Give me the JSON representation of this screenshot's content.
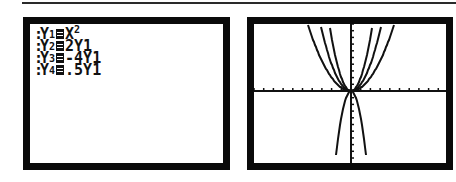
{
  "y_editor": {
    "functions": [
      {
        "name": "Y",
        "sub": "1",
        "expr": "X",
        "expr_sup": "2"
      },
      {
        "name": "Y",
        "sub": "2",
        "expr": "2Y1",
        "expr_sup": ""
      },
      {
        "name": "Y",
        "sub": "3",
        "expr": "-4Y1",
        "expr_sup": ""
      },
      {
        "name": "Y",
        "sub": "4",
        "expr": ".5Y1",
        "expr_sup": ""
      }
    ],
    "colon": ":"
  },
  "graph": {
    "window": {
      "xmin": -10,
      "xmax": 10,
      "ymin": -10,
      "ymax": 10,
      "xscl": 1,
      "yscl": 1
    },
    "curves": [
      {
        "label": "Y1 = X^2",
        "coef": 1
      },
      {
        "label": "Y2 = 2Y1",
        "coef": 2
      },
      {
        "label": "Y3 = -4Y1",
        "coef": -4
      },
      {
        "label": "Y4 = .5Y1",
        "coef": 0.5
      }
    ],
    "colors": {
      "frame": "#0a0a0a",
      "plot": "#111111",
      "background": "#ffffff"
    }
  }
}
